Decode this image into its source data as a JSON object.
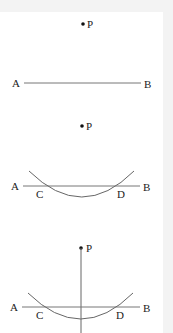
{
  "diagram": {
    "colors": {
      "background": "#ffffff",
      "margin": "#f3f3f3",
      "line": "#777777",
      "arc": "#666666",
      "point": "#111111",
      "text": "#222222"
    },
    "panels": [
      {
        "step": 1,
        "point_label": "P",
        "line_start_label": "A",
        "line_end_label": "B"
      },
      {
        "step": 2,
        "point_label": "P",
        "line_start_label": "A",
        "line_end_label": "B",
        "intersection_left_label": "C",
        "intersection_right_label": "D"
      },
      {
        "step": 3,
        "point_label": "P",
        "line_start_label": "A",
        "line_end_label": "B",
        "intersection_left_label": "C",
        "intersection_right_label": "D"
      }
    ]
  }
}
